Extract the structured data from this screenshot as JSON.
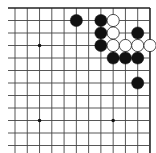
{
  "board": {
    "description": "Go board diagram, upper-right corner region",
    "cols": 12,
    "rows": 12,
    "origin_x": 15,
    "origin_y": 8,
    "spacing_x": 12.27,
    "spacing_y": 12.5,
    "edges": {
      "top": true,
      "right": true,
      "left": false,
      "bottom": false
    },
    "line_color": "#444444",
    "edge_color": "#222222",
    "star_points": [
      {
        "col": 2,
        "row": 3
      },
      {
        "col": 2,
        "row": 9
      },
      {
        "col": 8,
        "row": 9
      }
    ],
    "stones": [
      {
        "color": "black",
        "col": 5,
        "row": 1
      },
      {
        "color": "black",
        "col": 7,
        "row": 1
      },
      {
        "color": "white",
        "col": 8,
        "row": 1
      },
      {
        "color": "black",
        "col": 7,
        "row": 2
      },
      {
        "color": "white",
        "col": 8,
        "row": 2
      },
      {
        "color": "black",
        "col": 10,
        "row": 2
      },
      {
        "color": "black",
        "col": 7,
        "row": 3
      },
      {
        "color": "white",
        "col": 8,
        "row": 3
      },
      {
        "color": "white",
        "col": 9,
        "row": 3
      },
      {
        "color": "white",
        "col": 10,
        "row": 3
      },
      {
        "color": "white",
        "col": 11,
        "row": 3
      },
      {
        "color": "black",
        "col": 8,
        "row": 4
      },
      {
        "color": "black",
        "col": 9,
        "row": 4
      },
      {
        "color": "black",
        "col": 10,
        "row": 4
      },
      {
        "color": "black",
        "col": 10,
        "row": 6
      }
    ],
    "colors": {
      "black_stone": "#111111",
      "white_stone": "#ffffff",
      "white_outline": "#222222",
      "background": "#ffffff"
    }
  }
}
